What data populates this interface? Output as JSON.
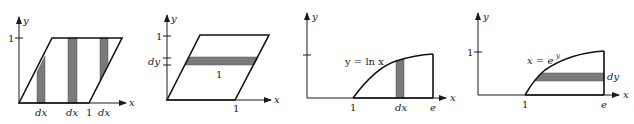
{
  "figure": {
    "panels": [
      {
        "id": "panel-1",
        "axis_labels": {
          "x": "x",
          "y": "y"
        },
        "y_tick_label": "1",
        "bottom_labels": [
          "dx",
          "dx",
          "1",
          "dx"
        ],
        "description": "Parallelogram with vertices (0,0),(1,0) offset, top edge at y=1; three vertical strips of width dx"
      },
      {
        "id": "panel-2",
        "axis_labels": {
          "x": "x",
          "y": "y"
        },
        "y_tick_labels": [
          "1",
          "dy"
        ],
        "strip_length_label": "1",
        "x_tick_label": "1",
        "description": "Parallelogram with one horizontal strip of height dy and length 1"
      },
      {
        "id": "panel-3",
        "axis_labels": {
          "x": "x",
          "y": "y"
        },
        "curve_label": "y = ln x",
        "x_tick_labels": [
          "1",
          "dx",
          "e"
        ],
        "description": "Region under y = ln x from x=1 to x=e with a vertical strip of width dx"
      },
      {
        "id": "panel-4",
        "axis_labels": {
          "x": "x",
          "y": "y"
        },
        "y_tick_label": "1",
        "curve_label": "x = e",
        "curve_label_superscript": "y",
        "strip_label": "dy",
        "x_tick_labels": [
          "1",
          "e"
        ],
        "description": "Same region described as x = e^y with a horizontal strip of height dy"
      }
    ],
    "colors": {
      "strip": "#7a7a7a",
      "line": "#111111",
      "background": "#ffffff"
    }
  }
}
